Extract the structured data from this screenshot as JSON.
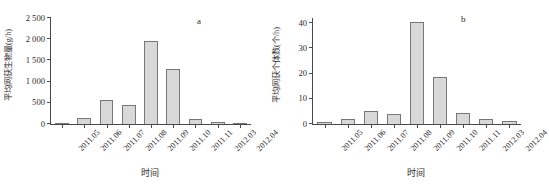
{
  "figure": {
    "panels": [
      {
        "letter": "a",
        "ylabel": "平均网获生物量(g/h)",
        "xlabel": "时间"
      },
      {
        "letter": "b",
        "ylabel": "平均网获个体数(个/h)",
        "xlabel": "时间"
      }
    ],
    "colors": {
      "bar_fill": "#d8d8d8",
      "bar_stroke": "#777777",
      "axis": "#4a4a4a",
      "text": "#2b2b2b",
      "background": "#ffffff"
    }
  },
  "chart_data": [
    {
      "type": "bar",
      "panel": "a",
      "title": "",
      "xlabel": "时间",
      "ylabel": "平均网获生物量(g/h)",
      "categories": [
        "2011.05",
        "2011.06",
        "2011.07",
        "2011.08",
        "2011.09",
        "2011.10",
        "2011.11",
        "2012.03",
        "2012.04"
      ],
      "values": [
        25,
        140,
        570,
        460,
        1960,
        1300,
        120,
        50,
        15
      ],
      "ylim": [
        0,
        2500
      ],
      "yticks": [
        0,
        500,
        1000,
        1500,
        2000,
        2500
      ],
      "ytick_labels": [
        "0",
        "500",
        "1 000",
        "1 500",
        "2 000",
        "2 500"
      ],
      "grid": false,
      "legend": false
    },
    {
      "type": "bar",
      "panel": "b",
      "title": "",
      "xlabel": "时间",
      "ylabel": "平均网获个体数(个/h)",
      "categories": [
        "2011.05",
        "2011.06",
        "2011.07",
        "2011.08",
        "2011.09",
        "2011.10",
        "2011.11",
        "2012.03",
        "2012.04"
      ],
      "values": [
        0.8,
        1.9,
        5.2,
        3.9,
        40.6,
        18.7,
        4.5,
        2.0,
        1.3
      ],
      "ylim": [
        0,
        42
      ],
      "yticks": [
        0,
        10,
        20,
        30,
        40
      ],
      "ytick_labels": [
        "0",
        "10",
        "20",
        "30",
        "40"
      ],
      "grid": false,
      "legend": false
    }
  ]
}
